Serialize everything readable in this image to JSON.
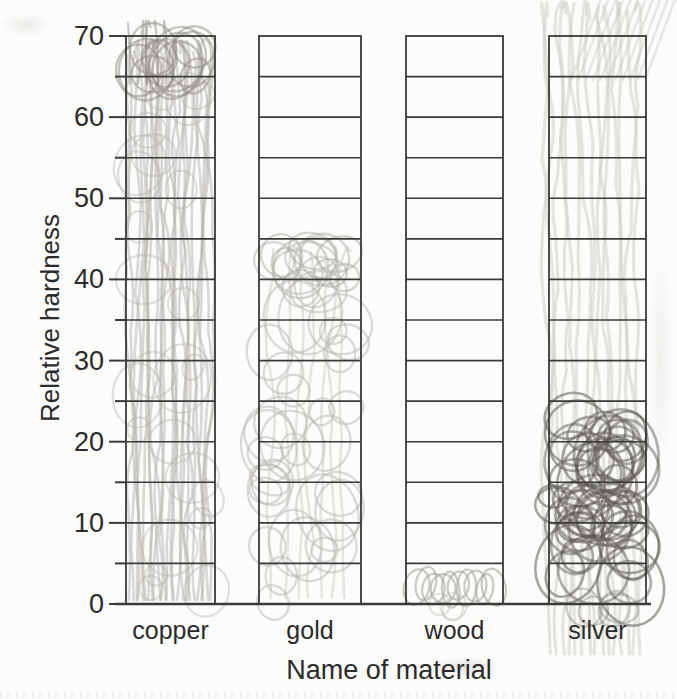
{
  "chart_data": {
    "type": "bar",
    "title": "",
    "xlabel": "Name of material",
    "ylabel": "Relative hardness",
    "categories": [
      "copper",
      "gold",
      "wood",
      "silver"
    ],
    "values": [
      70,
      45,
      5,
      25
    ],
    "ylim": [
      0,
      70
    ],
    "ytick_step": 10,
    "grid_step": 5,
    "ytick_labels": [
      "70",
      "60",
      "50",
      "40",
      "30",
      "20",
      "10",
      "0"
    ],
    "ytick_values": [
      70,
      60,
      50,
      40,
      30,
      20,
      10,
      0
    ],
    "legend": "none",
    "grid": "horizontal rules every 5 units inside each outlined column",
    "style_note": "scanned worksheet; each column outlined to 70 and hand-shaded with pencil scribble up to its value",
    "pencil_marks": {
      "copper": "light pencil strokes and loops filled to 70, darker tuft above the top line",
      "gold": "light pencil loops filled to 45, spilling slightly below the baseline",
      "wood": "small pencil loops in the 0-5 cell only",
      "silver": "dark pencil loops filled to 25 plus pale vertical smudge streaks over the whole column and diagonal smudges above it"
    }
  },
  "colors": {
    "paper": "#fcfcfa",
    "grid_line": "#3a3a38",
    "text": "#2b2b2b",
    "pencil_light": "#b3b0ad",
    "pencil_mid": "#8f8b88",
    "pencil_dark": "#6e6a67",
    "pencil_smudge": "#d2cfcc"
  }
}
